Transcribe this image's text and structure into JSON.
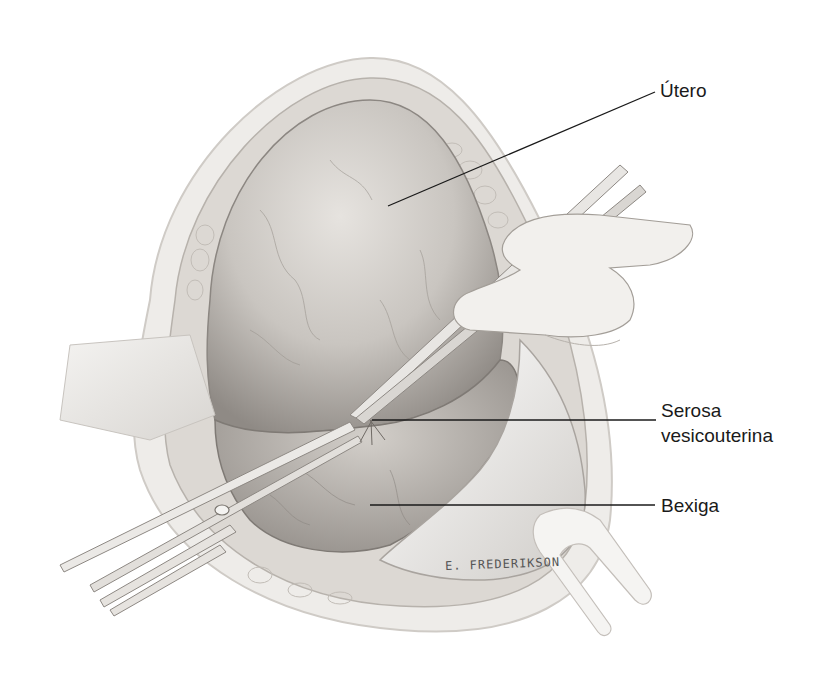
{
  "figure": {
    "labels": {
      "utero": "Útero",
      "serosa_line1": "Serosa",
      "serosa_line2": "vesicouterina",
      "bexiga": "Bexiga"
    },
    "signature": "E. FREDERIKSON",
    "colors": {
      "background": "#ffffff",
      "leader_line": "#1a1a1a",
      "tissue_dark": "#8a8580",
      "tissue_mid": "#b9b5b0",
      "tissue_light": "#dedbd7"
    }
  }
}
